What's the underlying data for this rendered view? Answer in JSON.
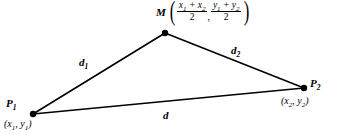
{
  "figure": {
    "background_color": "#ffffff",
    "stroke_color": "#000000",
    "vertices": {
      "p1": {
        "name": "P",
        "subscript": "1",
        "coord_open": "(",
        "x": "x",
        "x_sub": "1",
        "sep": ", ",
        "y": "y",
        "y_sub": "1",
        "coord_close": ")",
        "px": 33,
        "py": 114
      },
      "m": {
        "name": "M",
        "px": 165,
        "py": 33
      },
      "p2": {
        "name": "P",
        "subscript": "2",
        "coord_open": "(",
        "x": "x",
        "x_sub": "2",
        "sep": ", ",
        "y": "y",
        "y_sub": "2",
        "coord_close": ")",
        "px": 304,
        "py": 88
      }
    },
    "midpoint_expression": {
      "label": "M",
      "paren_open": "(",
      "paren_close": ")",
      "comma": ",",
      "x_numerator_a": "x",
      "x_numerator_a_sub": "1",
      "x_plus": " + ",
      "x_numerator_b": "x",
      "x_numerator_b_sub": "2",
      "x_denominator": "2",
      "y_numerator_a": "y",
      "y_numerator_a_sub": "1",
      "y_plus": " + ",
      "y_numerator_b": "y",
      "y_numerator_b_sub": "2",
      "y_denominator": "2"
    },
    "segments": {
      "d1": {
        "label": "d",
        "subscript": "1",
        "from": "p1",
        "to": "m"
      },
      "d2": {
        "label": "d",
        "subscript": "2",
        "from": "m",
        "to": "p2"
      },
      "d": {
        "label": "d",
        "subscript": "",
        "from": "p1",
        "to": "p2"
      }
    }
  }
}
